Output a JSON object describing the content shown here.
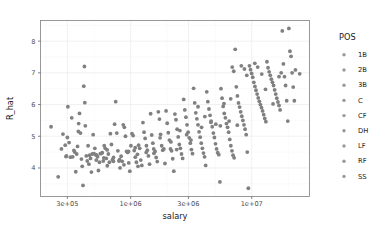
{
  "chart_data": {
    "type": "scatter",
    "title": "",
    "xlabel": "salary",
    "ylabel": "R_hat",
    "x_scale": "log",
    "y_scale": "linear",
    "grid": true,
    "xlim": [
      180000,
      30000000
    ],
    "ylim": [
      3.1,
      8.65
    ],
    "x_ticks": [
      {
        "value": 300000,
        "label": "3e+05"
      },
      {
        "value": 1000000,
        "label": "1e+06"
      },
      {
        "value": 3000000,
        "label": "3e+06"
      },
      {
        "value": 10000000,
        "label": "1e+07"
      }
    ],
    "y_ticks": [
      {
        "value": 4,
        "label": "4"
      },
      {
        "value": 5,
        "label": "5"
      },
      {
        "value": 6,
        "label": "6"
      },
      {
        "value": 7,
        "label": "7"
      },
      {
        "value": 8,
        "label": "8"
      }
    ],
    "point_color": "#808080",
    "point_radius": 1.9,
    "legend": {
      "title": "POS",
      "position": "right",
      "entries": [
        {
          "label": "1B",
          "color": "#9a9a9a"
        },
        {
          "label": "2B",
          "color": "#9a9a9a"
        },
        {
          "label": "3B",
          "color": "#9a9a9a"
        },
        {
          "label": "C",
          "color": "#9a9a9a"
        },
        {
          "label": "CF",
          "color": "#9a9a9a"
        },
        {
          "label": "DH",
          "color": "#9a9a9a"
        },
        {
          "label": "LF",
          "color": "#9a9a9a"
        },
        {
          "label": "RF",
          "color": "#9a9a9a"
        },
        {
          "label": "SS",
          "color": "#9a9a9a"
        }
      ]
    },
    "points": [
      [
        220000,
        5.3
      ],
      [
        252000,
        3.72
      ],
      [
        268000,
        4.6
      ],
      [
        276000,
        5.07
      ],
      [
        288000,
        4.72
      ],
      [
        292000,
        4.36
      ],
      [
        295000,
        4.38
      ],
      [
        300000,
        4.96
      ],
      [
        303000,
        5.93
      ],
      [
        310000,
        4.8
      ],
      [
        318000,
        4.34
      ],
      [
        326000,
        5.58
      ],
      [
        332000,
        4.35
      ],
      [
        340000,
        4.55
      ],
      [
        345000,
        4.5
      ],
      [
        352000,
        3.88
      ],
      [
        358000,
        4.44
      ],
      [
        364000,
        4.68
      ],
      [
        372000,
        5.4
      ],
      [
        378000,
        5.72
      ],
      [
        385000,
        5.1
      ],
      [
        392000,
        4.28
      ],
      [
        398000,
        4.05
      ],
      [
        404000,
        3.45
      ],
      [
        410000,
        6.58
      ],
      [
        415000,
        7.2
      ],
      [
        418000,
        6.06
      ],
      [
        422000,
        5.33
      ],
      [
        430000,
        4.38
      ],
      [
        438000,
        4.22
      ],
      [
        445000,
        4.7
      ],
      [
        452000,
        4.12
      ],
      [
        458000,
        4.4
      ],
      [
        466000,
        4.3
      ],
      [
        474000,
        3.87
      ],
      [
        482000,
        4.44
      ],
      [
        490000,
        5.05
      ],
      [
        498000,
        4.45
      ],
      [
        506000,
        4.62
      ],
      [
        515000,
        4.42
      ],
      [
        524000,
        4.4
      ],
      [
        533000,
        4.35
      ],
      [
        542000,
        3.92
      ],
      [
        552000,
        4.18
      ],
      [
        562000,
        4.45
      ],
      [
        572000,
        4.46
      ],
      [
        583000,
        4.48
      ],
      [
        594000,
        4.22
      ],
      [
        605000,
        4.7
      ],
      [
        617000,
        4.62
      ],
      [
        629000,
        4.3
      ],
      [
        641000,
        4.07
      ],
      [
        654000,
        4.44
      ],
      [
        667000,
        4.18
      ],
      [
        680000,
        5.08
      ],
      [
        694000,
        4.74
      ],
      [
        708000,
        4.26
      ],
      [
        722000,
        4.33
      ],
      [
        737000,
        5.38
      ],
      [
        752000,
        6.09
      ],
      [
        768000,
        5.1
      ],
      [
        784000,
        4.54
      ],
      [
        800000,
        4.22
      ],
      [
        817000,
        4.0
      ],
      [
        834000,
        4.37
      ],
      [
        851000,
        4.21
      ],
      [
        869000,
        5.36
      ],
      [
        887000,
        5.28
      ],
      [
        906000,
        5.0
      ],
      [
        925000,
        4.52
      ],
      [
        944000,
        4.49
      ],
      [
        964000,
        4.16
      ],
      [
        984000,
        3.9
      ],
      [
        1005000,
        4.7
      ],
      [
        1026000,
        5.08
      ],
      [
        1048000,
        5.02
      ],
      [
        1070000,
        4.55
      ],
      [
        1092000,
        4.34
      ],
      [
        1115000,
        4.18
      ],
      [
        1138000,
        4.43
      ],
      [
        1162000,
        4.72
      ],
      [
        1187000,
        4.62
      ],
      [
        1212000,
        4.25
      ],
      [
        1237000,
        4.08
      ],
      [
        1263000,
        5.43
      ],
      [
        1290000,
        5.13
      ],
      [
        1317000,
        4.93
      ],
      [
        1345000,
        4.49
      ],
      [
        1373000,
        4.56
      ],
      [
        1402000,
        4.38
      ],
      [
        1432000,
        4.12
      ],
      [
        1462000,
        5.71
      ],
      [
        1493000,
        5.04
      ],
      [
        1525000,
        4.78
      ],
      [
        1557000,
        4.46
      ],
      [
        1590000,
        4.52
      ],
      [
        1624000,
        4.33
      ],
      [
        1658000,
        4.2
      ],
      [
        1693000,
        5.77
      ],
      [
        1729000,
        5.54
      ],
      [
        1766000,
        5.06
      ],
      [
        1803000,
        4.7
      ],
      [
        1841000,
        4.56
      ],
      [
        1880000,
        4.6
      ],
      [
        1920000,
        4.14
      ],
      [
        1961000,
        5.8
      ],
      [
        2003000,
        5.41
      ],
      [
        2046000,
        5.11
      ],
      [
        2089000,
        4.88
      ],
      [
        2133000,
        4.6
      ],
      [
        2178000,
        4.54
      ],
      [
        2225000,
        4.29
      ],
      [
        2272000,
        3.9
      ],
      [
        2320000,
        5.7
      ],
      [
        2369000,
        5.52
      ],
      [
        2419000,
        5.22
      ],
      [
        2470000,
        4.98
      ],
      [
        2522000,
        4.74
      ],
      [
        2575000,
        4.62
      ],
      [
        2630000,
        4.44
      ],
      [
        2686000,
        4.3
      ],
      [
        2742000,
        6.16
      ],
      [
        2800000,
        5.83
      ],
      [
        2860000,
        5.6
      ],
      [
        2920000,
        5.36
      ],
      [
        2982000,
        5.13
      ],
      [
        3045000,
        4.95
      ],
      [
        3109000,
        4.78
      ],
      [
        3175000,
        4.58
      ],
      [
        3242000,
        4.45
      ],
      [
        3310000,
        6.51
      ],
      [
        3380000,
        6.05
      ],
      [
        3451000,
        5.74
      ],
      [
        3524000,
        5.55
      ],
      [
        3598000,
        5.36
      ],
      [
        3674000,
        5.14
      ],
      [
        3751000,
        4.97
      ],
      [
        3830000,
        4.78
      ],
      [
        3911000,
        4.62
      ],
      [
        3993000,
        4.47
      ],
      [
        4077000,
        4.35
      ],
      [
        4163000,
        4.08
      ],
      [
        4251000,
        6.4
      ],
      [
        4340000,
        6.09
      ],
      [
        4432000,
        5.86
      ],
      [
        4525000,
        5.66
      ],
      [
        4620000,
        5.48
      ],
      [
        4717000,
        5.3
      ],
      [
        4817000,
        5.1
      ],
      [
        4918000,
        4.96
      ],
      [
        5021000,
        4.76
      ],
      [
        5127000,
        4.6
      ],
      [
        5235000,
        4.48
      ],
      [
        5345000,
        4.42
      ],
      [
        5457000,
        3.56
      ],
      [
        5572000,
        6.5
      ],
      [
        5689000,
        6.2
      ],
      [
        5809000,
        5.94
      ],
      [
        5931000,
        5.72
      ],
      [
        6056000,
        5.58
      ],
      [
        6183000,
        5.4
      ],
      [
        6314000,
        5.28
      ],
      [
        6446000,
        5.13
      ],
      [
        6582000,
        4.9
      ],
      [
        6721000,
        4.7
      ],
      [
        6862000,
        4.54
      ],
      [
        7006000,
        4.4
      ],
      [
        7153000,
        4.32
      ],
      [
        7304000,
        7.74
      ],
      [
        7457000,
        6.56
      ],
      [
        7614000,
        6.27
      ],
      [
        7774000,
        6.05
      ],
      [
        7938000,
        5.92
      ],
      [
        8105000,
        5.77
      ],
      [
        8276000,
        5.63
      ],
      [
        8450000,
        5.5
      ],
      [
        8628000,
        5.36
      ],
      [
        8810000,
        5.22
      ],
      [
        8995000,
        5.05
      ],
      [
        9184000,
        4.5
      ],
      [
        9377000,
        3.36
      ],
      [
        9575000,
        7.22
      ],
      [
        9776000,
        7.1
      ],
      [
        9982000,
        6.98
      ],
      [
        10192000,
        6.86
      ],
      [
        10407000,
        6.7
      ],
      [
        10626000,
        6.57
      ],
      [
        10850000,
        6.45
      ],
      [
        11078000,
        6.33
      ],
      [
        11311000,
        6.21
      ],
      [
        11549000,
        6.1
      ],
      [
        11792000,
        6.0
      ],
      [
        12040000,
        5.9
      ],
      [
        12294000,
        5.8
      ],
      [
        12552000,
        5.68
      ],
      [
        12816000,
        5.56
      ],
      [
        13086000,
        5.46
      ],
      [
        13361000,
        7.35
      ],
      [
        13642000,
        7.16
      ],
      [
        13929000,
        7.03
      ],
      [
        14222000,
        6.92
      ],
      [
        14521000,
        6.8
      ],
      [
        14827000,
        6.7
      ],
      [
        15139000,
        6.6
      ],
      [
        15458000,
        6.46
      ],
      [
        15783000,
        6.33
      ],
      [
        16115000,
        6.2
      ],
      [
        16454000,
        6.08
      ],
      [
        16800000,
        5.97
      ],
      [
        17153000,
        5.83
      ],
      [
        17514000,
        7.0
      ],
      [
        17882000,
        8.32
      ],
      [
        18258000,
        7.28
      ],
      [
        18642000,
        6.88
      ],
      [
        19034000,
        6.6
      ],
      [
        19434000,
        6.12
      ],
      [
        19843000,
        5.48
      ],
      [
        20260000,
        8.4
      ],
      [
        20686000,
        7.68
      ],
      [
        21121000,
        7.52
      ],
      [
        21565000,
        7.0
      ],
      [
        22018000,
        6.55
      ],
      [
        22481000,
        6.12
      ],
      [
        22954000,
        7.09
      ],
      [
        24900000,
        6.97
      ],
      [
        6900000,
        7.18
      ],
      [
        7100000,
        7.05
      ],
      [
        8200000,
        7.22
      ],
      [
        8700000,
        7.12
      ],
      [
        9100000,
        6.92
      ],
      [
        10600000,
        7.3
      ],
      [
        11200000,
        7.18
      ],
      [
        12100000,
        6.96
      ],
      [
        3600000,
        5.93
      ],
      [
        4100000,
        5.62
      ],
      [
        4600000,
        5.44
      ],
      [
        5050000,
        5.38
      ],
      [
        5500000,
        5.33
      ],
      [
        2550000,
        5.18
      ],
      [
        2900000,
        5.05
      ],
      [
        3150000,
        4.88
      ],
      [
        1350000,
        4.7
      ],
      [
        1550000,
        4.6
      ],
      [
        1750000,
        4.95
      ],
      [
        640000,
        4.57
      ],
      [
        720000,
        4.21
      ],
      [
        880000,
        4.1
      ],
      [
        960000,
        4.52
      ],
      [
        1090000,
        4.64
      ],
      [
        370000,
        5.15
      ],
      [
        520000,
        4.25
      ],
      [
        600000,
        4.32
      ],
      [
        810000,
        4.26
      ],
      [
        1150000,
        4.05
      ],
      [
        2150000,
        4.82
      ],
      [
        2400000,
        4.58
      ],
      [
        3850000,
        5.28
      ],
      [
        6500000,
        5.48
      ],
      [
        7600000,
        5.35
      ],
      [
        13000000,
        6.48
      ],
      [
        15000000,
        6.02
      ],
      [
        16800000,
        6.88
      ],
      [
        5900000,
        6.03
      ],
      [
        6700000,
        6.18
      ]
    ]
  }
}
